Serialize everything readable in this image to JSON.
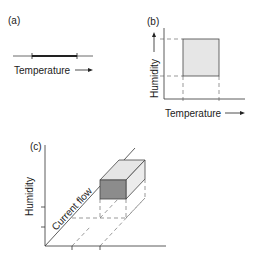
{
  "panels": {
    "a": {
      "label": "(a)",
      "xlabel": "Temperature"
    },
    "b": {
      "label": "(b)",
      "xlabel": "Temperature",
      "ylabel": "Humidity"
    },
    "c": {
      "label": "(c)",
      "ylabel": "Humidity",
      "diag_label": "Current flow"
    }
  },
  "colors": {
    "fill_light": "#e6e6e6",
    "fill_dark": "#8c8c8c",
    "line": "#333333"
  }
}
